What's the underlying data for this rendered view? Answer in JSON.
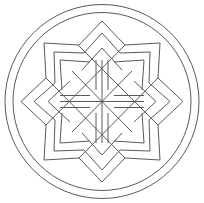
{
  "image": {
    "description": "Geometric mandala line art: eight-pointed star with nested outlines inside two concentric circles",
    "stroke_color": "#555555",
    "background": "#ffffff"
  }
}
